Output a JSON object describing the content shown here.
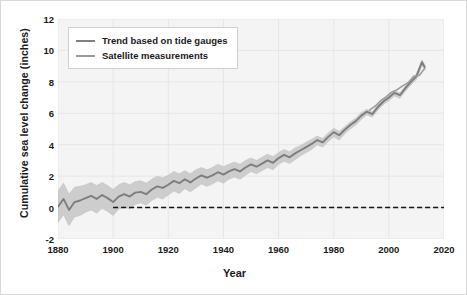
{
  "chart_data": {
    "type": "line",
    "title": "",
    "xlabel": "Year",
    "ylabel": "Cumulative sea level change (inches)",
    "xlim": [
      1880,
      2020
    ],
    "ylim": [
      -2,
      12
    ],
    "xticks": [
      1880,
      1900,
      1920,
      1940,
      1960,
      1980,
      2000,
      2020
    ],
    "yticks": [
      -2,
      0,
      2,
      4,
      6,
      8,
      10,
      12
    ],
    "grid": true,
    "legend_position": "upper-left-inside",
    "legend": [
      {
        "label": "Trend based on tide gauges",
        "color": "#808080"
      },
      {
        "label": "Satellite measurements",
        "color": "#9a9a9a"
      }
    ],
    "annotations": [
      {
        "type": "reference-line",
        "style": "dashed",
        "y": 0,
        "x_start": 1900,
        "x_end": 2020,
        "color": "#111111"
      }
    ],
    "series": [
      {
        "name": "Trend based on tide gauges",
        "color": "#7d7d7d",
        "x": [
          1880,
          1882,
          1884,
          1886,
          1888,
          1890,
          1892,
          1894,
          1896,
          1898,
          1900,
          1902,
          1904,
          1906,
          1908,
          1910,
          1912,
          1914,
          1916,
          1918,
          1920,
          1922,
          1924,
          1926,
          1928,
          1930,
          1932,
          1934,
          1936,
          1938,
          1940,
          1942,
          1944,
          1946,
          1948,
          1950,
          1952,
          1954,
          1956,
          1958,
          1960,
          1962,
          1964,
          1966,
          1968,
          1970,
          1972,
          1974,
          1976,
          1978,
          1980,
          1982,
          1984,
          1986,
          1988,
          1990,
          1992,
          1994,
          1996,
          1998,
          2000,
          2002,
          2004,
          2006,
          2008,
          2010,
          2012,
          2013
        ],
        "values": [
          0.05,
          0.55,
          -0.15,
          0.35,
          0.45,
          0.6,
          0.75,
          0.55,
          0.8,
          0.6,
          0.35,
          0.7,
          0.85,
          0.7,
          0.95,
          1.0,
          0.85,
          1.15,
          1.35,
          1.25,
          1.45,
          1.7,
          1.55,
          1.8,
          1.6,
          1.85,
          2.05,
          1.9,
          2.05,
          2.25,
          2.1,
          2.3,
          2.45,
          2.3,
          2.55,
          2.75,
          2.6,
          2.8,
          3.0,
          2.85,
          3.15,
          3.35,
          3.2,
          3.45,
          3.65,
          3.85,
          4.05,
          4.3,
          4.15,
          4.5,
          4.8,
          4.6,
          4.95,
          5.25,
          5.5,
          5.85,
          6.1,
          5.95,
          6.4,
          6.75,
          7.0,
          7.3,
          7.15,
          7.6,
          8.0,
          8.35,
          9.25,
          8.95
        ],
        "band_upper": [
          1.05,
          1.55,
          0.85,
          1.3,
          1.35,
          1.45,
          1.6,
          1.4,
          1.6,
          1.4,
          1.15,
          1.45,
          1.6,
          1.45,
          1.65,
          1.7,
          1.55,
          1.8,
          2.0,
          1.9,
          2.05,
          2.3,
          2.15,
          2.35,
          2.15,
          2.4,
          2.55,
          2.4,
          2.55,
          2.75,
          2.6,
          2.75,
          2.9,
          2.75,
          3.0,
          3.15,
          3.0,
          3.2,
          3.4,
          3.25,
          3.5,
          3.7,
          3.55,
          3.8,
          3.95,
          4.15,
          4.35,
          4.55,
          4.4,
          4.75,
          5.05,
          4.85,
          5.15,
          5.45,
          5.7,
          6.05,
          6.25,
          6.1,
          6.55,
          6.9,
          7.15,
          7.45,
          7.3,
          7.75,
          8.15,
          8.5,
          9.4,
          9.1
        ],
        "band_lower": [
          -0.95,
          -0.45,
          -1.15,
          -0.6,
          -0.5,
          -0.3,
          -0.15,
          -0.35,
          -0.05,
          -0.25,
          -0.5,
          -0.1,
          0.05,
          -0.1,
          0.2,
          0.3,
          0.15,
          0.45,
          0.65,
          0.55,
          0.8,
          1.05,
          0.9,
          1.2,
          1.0,
          1.25,
          1.5,
          1.35,
          1.5,
          1.7,
          1.55,
          1.8,
          1.95,
          1.8,
          2.05,
          2.3,
          2.15,
          2.35,
          2.55,
          2.4,
          2.75,
          2.95,
          2.8,
          3.05,
          3.3,
          3.5,
          3.7,
          4.0,
          3.85,
          4.2,
          4.5,
          4.3,
          4.7,
          5.0,
          5.25,
          5.6,
          5.9,
          5.75,
          6.2,
          6.55,
          6.8,
          7.1,
          6.95,
          7.4,
          7.8,
          8.15,
          9.05,
          8.75
        ]
      },
      {
        "name": "Satellite measurements",
        "color": "#9a9a9a",
        "x": [
          1993,
          1995,
          1997,
          1999,
          2001,
          2003,
          2005,
          2007,
          2009,
          2011,
          2013
        ],
        "values": [
          6.2,
          6.45,
          6.8,
          7.05,
          7.35,
          7.5,
          7.75,
          7.95,
          8.35,
          8.4,
          8.85
        ]
      }
    ]
  },
  "axes": {
    "ylabel": "Cumulative sea level change (inches)",
    "xlabel": "Year",
    "yticks": [
      "12",
      "10",
      "8",
      "6",
      "4",
      "2",
      "0",
      "-2"
    ],
    "xticks": [
      "1880",
      "1900",
      "1920",
      "1940",
      "1960",
      "1980",
      "2000",
      "2020"
    ]
  },
  "legend": {
    "items": [
      {
        "label": "Trend based on tide gauges"
      },
      {
        "label": "Satellite measurements"
      }
    ]
  }
}
